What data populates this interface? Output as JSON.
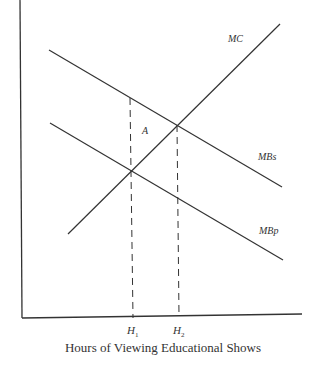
{
  "diagram": {
    "type": "economics-externality",
    "x_axis_label": "Hours of Viewing Educational Shows",
    "y_axis_label": "",
    "caption_partial": "",
    "curves": [
      {
        "name": "MC",
        "label": "MC",
        "description": "Marginal cost, upward sloping"
      },
      {
        "name": "MBs",
        "label": "MBs",
        "description": "Marginal social benefit, downward sloping"
      },
      {
        "name": "MBp",
        "label": "MBp",
        "description": "Marginal private benefit, downward sloping"
      }
    ],
    "region_label": "A",
    "quantity_markers": [
      {
        "name": "H1",
        "base": "H",
        "sub": "1"
      },
      {
        "name": "H2",
        "base": "H",
        "sub": "2"
      }
    ],
    "colors": {
      "line": "#333333",
      "background": "#ffffff"
    }
  }
}
